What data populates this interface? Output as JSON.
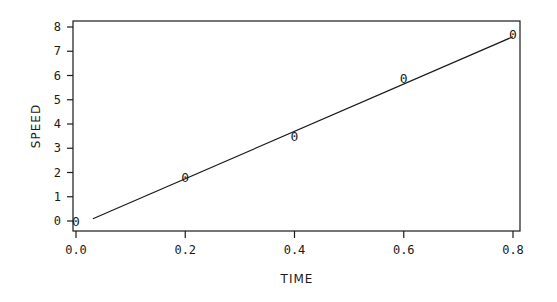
{
  "chart_data": {
    "type": "scatter",
    "title": "",
    "xlabel": "TIME",
    "ylabel": "SPEED",
    "xlim": [
      0.0,
      0.8
    ],
    "ylim": [
      0,
      8
    ],
    "grid": false,
    "legend": null,
    "x_ticks": [
      "0.0",
      "0.2",
      "0.4",
      "0.6",
      "0.8"
    ],
    "y_ticks": [
      "0",
      "1",
      "2",
      "3",
      "4",
      "5",
      "6",
      "7",
      "8"
    ],
    "marker_glyph": "0",
    "series": [
      {
        "name": "measured",
        "type": "scatter",
        "x": [
          0.0,
          0.2,
          0.4,
          0.6,
          0.8
        ],
        "y": [
          0.0,
          1.8,
          3.5,
          5.9,
          7.7
        ]
      },
      {
        "name": "fit",
        "type": "line",
        "x": [
          0.02,
          0.8
        ],
        "y": [
          0.05,
          7.6
        ]
      }
    ],
    "colors": {
      "ink": "#1a1a1a",
      "background": "#ffffff"
    }
  }
}
